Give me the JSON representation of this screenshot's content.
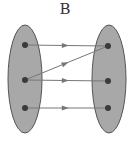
{
  "title": "B",
  "colors": {
    "set_fill": "#a8a8a8",
    "set_stroke": "#555555",
    "dot": "#3a3a3a",
    "arrow": "#777777"
  },
  "sets": [
    {
      "name": "domain",
      "cx": 25,
      "cy": 79,
      "rx": 17,
      "ry": 54,
      "elements": [
        {
          "x": 25,
          "y": 45
        },
        {
          "x": 25,
          "y": 80
        },
        {
          "x": 25,
          "y": 108
        }
      ]
    },
    {
      "name": "codomain",
      "cx": 109,
      "cy": 79,
      "rx": 17,
      "ry": 54,
      "elements": [
        {
          "x": 108,
          "y": 46
        },
        {
          "x": 108,
          "y": 81
        },
        {
          "x": 108,
          "y": 108
        }
      ]
    }
  ],
  "mappings": [
    {
      "from": [
        25,
        45
      ],
      "to": [
        108,
        46
      ]
    },
    {
      "from": [
        25,
        80
      ],
      "to": [
        108,
        46
      ]
    },
    {
      "from": [
        25,
        80
      ],
      "to": [
        108,
        81
      ]
    },
    {
      "from": [
        25,
        108
      ],
      "to": [
        108,
        108
      ]
    }
  ]
}
